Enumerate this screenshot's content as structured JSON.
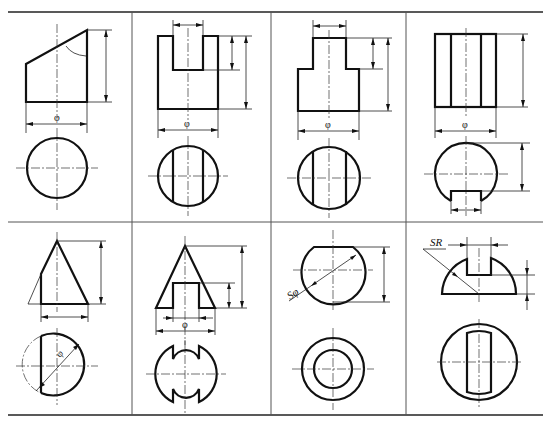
{
  "figure": {
    "type": "engineering-drawing-table",
    "rows": 2,
    "columns": 4,
    "line_color": "#111111",
    "background": "#ffffff"
  },
  "labels": {
    "diameter": "φ",
    "sphere_diameter": "Sφ",
    "sphere_radius": "SR"
  },
  "cells": [
    {
      "row": 1,
      "col": 1,
      "name": "truncated-cylinder-oblique-cut",
      "front_view": "rectangle with slanted top",
      "top_view": "circle",
      "dims": [
        "φ",
        "height",
        "angle"
      ]
    },
    {
      "row": 1,
      "col": 2,
      "name": "cylinder-with-top-slot",
      "front_view": "rectangle with rectangular notch at top",
      "top_view": "circle with two vertical chords",
      "dims": [
        "φ",
        "slot width",
        "slot depth",
        "height"
      ]
    },
    {
      "row": 1,
      "col": 3,
      "name": "stepped-cylinder-flats",
      "front_view": "stepped profile",
      "top_view": "circle with two vertical chords",
      "dims": [
        "φ",
        "step width",
        "step height",
        "height"
      ]
    },
    {
      "row": 1,
      "col": 4,
      "name": "cylinder-with-bottom-flat",
      "front_view": "rectangle with two inner vertical lines",
      "top_view": "circle with flat bottom and notch",
      "dims": [
        "φ",
        "height",
        "flat distance",
        "notch width"
      ]
    },
    {
      "row": 2,
      "col": 1,
      "name": "cut-cone",
      "front_view": "triangle with vertical cut on left",
      "top_view": "circle with chord",
      "dims": [
        "φ",
        "base",
        "height"
      ]
    },
    {
      "row": 2,
      "col": 2,
      "name": "cone-with-slot",
      "front_view": "triangle with rectangular slot at base",
      "top_view": "circle with two notches",
      "dims": [
        "φ",
        "slot width",
        "slot height",
        "height"
      ]
    },
    {
      "row": 2,
      "col": 3,
      "name": "truncated-sphere",
      "front_view": "circle cut flat on top",
      "top_view": "two concentric circles",
      "dims": [
        "Sφ",
        "height"
      ]
    },
    {
      "row": 2,
      "col": 4,
      "name": "slotted-hemisphere",
      "front_view": "half circle with top slot",
      "top_view": "circle with central slot outline",
      "dims": [
        "SR",
        "slot width",
        "slot depth"
      ]
    }
  ]
}
